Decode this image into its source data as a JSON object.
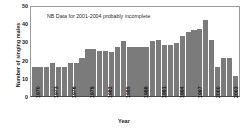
{
  "chart_data": {
    "type": "bar",
    "title": "",
    "xlabel": "Year",
    "ylabel": "Number of singing males",
    "ylim": [
      0,
      50
    ],
    "yticks": [
      0,
      10,
      20,
      30,
      40,
      50
    ],
    "xtick_labels": [
      "1970",
      "1973",
      "1976",
      "1979",
      "1982",
      "1985",
      "1988",
      "1991",
      "1994",
      "1997",
      "2000",
      "2003"
    ],
    "grid": false,
    "legend": null,
    "annotations": [
      {
        "text": "NB Data for 2001-2004 probably incomplete",
        "x": 1974,
        "y": 45
      }
    ],
    "bar_color": "#7b7b7b",
    "categories": [
      "1970",
      "1971",
      "1972",
      "1973",
      "1974",
      "1975",
      "1976",
      "1977",
      "1978",
      "1979",
      "1980",
      "1981",
      "1982",
      "1983",
      "1984",
      "1985",
      "1986",
      "1987",
      "1988",
      "1989",
      "1990",
      "1991",
      "1992",
      "1993",
      "1994",
      "1995",
      "1996",
      "1997",
      "1998",
      "1999",
      "2000",
      "2001",
      "2002",
      "2003",
      "2004"
    ],
    "values": [
      16,
      16,
      16,
      18,
      16,
      16,
      18,
      18,
      21,
      26,
      26,
      25,
      25,
      24,
      27,
      30,
      27,
      27,
      27,
      27,
      30,
      31,
      28,
      28,
      29,
      33,
      35,
      36,
      37,
      42,
      31,
      16,
      21,
      21,
      11
    ]
  },
  "axis": {
    "y_title": "Number of singing males",
    "x_title": "Year"
  }
}
